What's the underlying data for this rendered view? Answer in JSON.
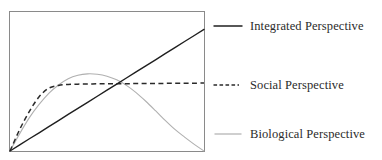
{
  "figure": {
    "background_color": "#ffffff",
    "frame_color": "#8a8a8a"
  },
  "legend": {
    "position": "right",
    "items": [
      {
        "label": "Integrated Perspective",
        "style": "solid",
        "color": "#1f1f1f",
        "width": 1.4,
        "swatch_name": "solid-line-swatch"
      },
      {
        "label": "Social Perspective",
        "style": "dashed",
        "color": "#2a2a2a",
        "width": 1.4,
        "swatch_name": "dashed-line-swatch"
      },
      {
        "label": "Biological Perspective",
        "style": "solid",
        "color": "#b0b0b0",
        "width": 1.1,
        "swatch_name": "light-line-swatch"
      }
    ]
  },
  "chart_data": {
    "type": "line",
    "title": "",
    "xlabel": "",
    "ylabel": "",
    "xlim": [
      0,
      1
    ],
    "ylim": [
      0,
      1
    ],
    "grid": false,
    "axis_ticks": false,
    "legend_position": "right",
    "x": [
      0.0,
      0.05,
      0.1,
      0.15,
      0.2,
      0.25,
      0.3,
      0.35,
      0.4,
      0.45,
      0.5,
      0.55,
      0.6,
      0.65,
      0.7,
      0.75,
      0.8,
      0.85,
      0.9,
      0.95,
      1.0
    ],
    "series": [
      {
        "name": "Integrated Perspective",
        "style": "solid",
        "color": "#1f1f1f",
        "shape": "linear",
        "values": [
          0.0,
          0.044,
          0.088,
          0.131,
          0.175,
          0.219,
          0.263,
          0.306,
          0.35,
          0.394,
          0.438,
          0.481,
          0.525,
          0.569,
          0.613,
          0.656,
          0.7,
          0.744,
          0.788,
          0.831,
          0.875
        ]
      },
      {
        "name": "Social Perspective",
        "style": "dashed",
        "color": "#2a2a2a",
        "shape": "negatively-accelerated-plateau",
        "values": [
          0.0,
          0.155,
          0.285,
          0.39,
          0.452,
          0.472,
          0.479,
          0.481,
          0.482,
          0.483,
          0.4835,
          0.484,
          0.4845,
          0.485,
          0.4855,
          0.486,
          0.4865,
          0.487,
          0.4875,
          0.488,
          0.4885
        ]
      },
      {
        "name": "Biological Perspective",
        "style": "solid",
        "color": "#b0b0b0",
        "shape": "inverted-u",
        "values": [
          0.0,
          0.125,
          0.24,
          0.335,
          0.415,
          0.475,
          0.52,
          0.545,
          0.555,
          0.552,
          0.538,
          0.512,
          0.472,
          0.42,
          0.358,
          0.29,
          0.22,
          0.155,
          0.1,
          0.048,
          0.0
        ]
      }
    ]
  }
}
